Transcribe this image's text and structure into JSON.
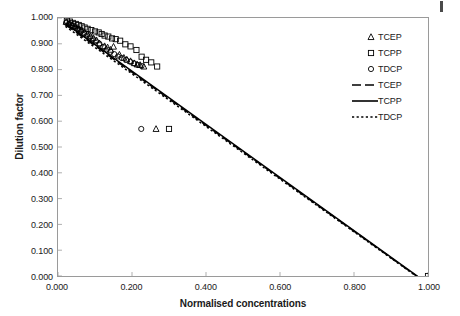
{
  "chart_data": {
    "type": "scatter",
    "title": "",
    "xlabel": "Normalised concentrations",
    "ylabel": "Dilution factor",
    "xlim": [
      0.0,
      1.0
    ],
    "ylim": [
      0.0,
      1.0
    ],
    "xticks": [
      "0.000",
      "0.200",
      "0.400",
      "0.600",
      "0.800",
      "1.000"
    ],
    "xtick_values": [
      0.0,
      0.2,
      0.4,
      0.6,
      0.8,
      1.0
    ],
    "yticks": [
      "0.000",
      "0.100",
      "0.200",
      "0.300",
      "0.400",
      "0.500",
      "0.600",
      "0.700",
      "0.800",
      "0.900",
      "1.000"
    ],
    "ytick_values": [
      0.0,
      0.1,
      0.2,
      0.3,
      0.4,
      0.5,
      0.6,
      0.7,
      0.8,
      0.9,
      1.0
    ],
    "grid": false,
    "legend_position": "top-right",
    "marker_series": [
      {
        "name": "TCEP",
        "marker": "triangle",
        "color": "#000000",
        "points": [
          [
            0.022,
            0.985
          ],
          [
            0.03,
            0.979
          ],
          [
            0.038,
            0.974
          ],
          [
            0.046,
            0.969
          ],
          [
            0.052,
            0.962
          ],
          [
            0.058,
            0.957
          ],
          [
            0.064,
            0.953
          ],
          [
            0.072,
            0.944
          ],
          [
            0.08,
            0.937
          ],
          [
            0.088,
            0.93
          ],
          [
            0.096,
            0.922
          ],
          [
            0.104,
            0.914
          ],
          [
            0.112,
            0.902
          ],
          [
            0.126,
            0.891
          ],
          [
            0.134,
            0.886
          ],
          [
            0.142,
            0.877
          ],
          [
            0.15,
            0.889
          ],
          [
            0.166,
            0.858
          ],
          [
            0.178,
            0.846
          ],
          [
            0.186,
            0.839
          ],
          [
            0.196,
            0.833
          ],
          [
            0.206,
            0.825
          ],
          [
            0.214,
            0.82
          ],
          [
            0.222,
            0.818
          ],
          [
            0.232,
            0.812
          ],
          [
            0.265,
            0.57
          ]
        ]
      },
      {
        "name": "TCPP",
        "marker": "square",
        "color": "#000000",
        "points": [
          [
            0.024,
            0.99
          ],
          [
            0.032,
            0.986
          ],
          [
            0.04,
            0.981
          ],
          [
            0.048,
            0.977
          ],
          [
            0.056,
            0.973
          ],
          [
            0.064,
            0.968
          ],
          [
            0.072,
            0.963
          ],
          [
            0.08,
            0.958
          ],
          [
            0.09,
            0.953
          ],
          [
            0.1,
            0.948
          ],
          [
            0.11,
            0.944
          ],
          [
            0.118,
            0.938
          ],
          [
            0.126,
            0.932
          ],
          [
            0.136,
            0.928
          ],
          [
            0.146,
            0.921
          ],
          [
            0.156,
            0.918
          ],
          [
            0.168,
            0.912
          ],
          [
            0.182,
            0.898
          ],
          [
            0.196,
            0.89
          ],
          [
            0.212,
            0.876
          ],
          [
            0.226,
            0.85
          ],
          [
            0.238,
            0.838
          ],
          [
            0.252,
            0.828
          ],
          [
            0.268,
            0.812
          ],
          [
            0.3,
            0.57
          ],
          [
            1.0,
            0.0
          ]
        ]
      },
      {
        "name": "TDCP",
        "marker": "circle",
        "color": "#000000",
        "points": [
          [
            0.022,
            0.982
          ],
          [
            0.03,
            0.976
          ],
          [
            0.038,
            0.97
          ],
          [
            0.046,
            0.963
          ],
          [
            0.054,
            0.956
          ],
          [
            0.062,
            0.948
          ],
          [
            0.07,
            0.94
          ],
          [
            0.078,
            0.932
          ],
          [
            0.086,
            0.925
          ],
          [
            0.094,
            0.918
          ],
          [
            0.102,
            0.91
          ],
          [
            0.112,
            0.9
          ],
          [
            0.122,
            0.888
          ],
          [
            0.132,
            0.878
          ],
          [
            0.142,
            0.869
          ],
          [
            0.152,
            0.86
          ],
          [
            0.162,
            0.851
          ],
          [
            0.172,
            0.845
          ],
          [
            0.184,
            0.838
          ],
          [
            0.196,
            0.83
          ],
          [
            0.206,
            0.824
          ],
          [
            0.216,
            0.818
          ],
          [
            0.226,
            0.814
          ],
          [
            0.225,
            0.57
          ]
        ]
      }
    ],
    "line_series": [
      {
        "name": "TCEP",
        "style": "dashed",
        "color": "#000000",
        "intercept": 0.995,
        "slope": -1.027,
        "x_range": [
          0.02,
          0.972
        ]
      },
      {
        "name": "TCPP",
        "style": "solid",
        "color": "#000000",
        "intercept": 1.0,
        "slope": -1.03,
        "x_range": [
          0.02,
          0.972
        ]
      },
      {
        "name": "TDCP",
        "style": "dotted",
        "color": "#000000",
        "intercept": 0.988,
        "slope": -1.021,
        "x_range": [
          0.02,
          0.968
        ]
      }
    ]
  },
  "legend": {
    "entries": [
      {
        "label": "TCEP",
        "kind": "marker",
        "marker": "triangle"
      },
      {
        "label": "TCPP",
        "kind": "marker",
        "marker": "square"
      },
      {
        "label": "TDCP",
        "kind": "marker",
        "marker": "circle"
      },
      {
        "label": "TCEP",
        "kind": "line",
        "style": "dashed"
      },
      {
        "label": "TCPP",
        "kind": "line",
        "style": "solid"
      },
      {
        "label": "TDCP",
        "kind": "line",
        "style": "dotted"
      }
    ]
  },
  "axes": {
    "x_title": "Normalised concentrations",
    "y_title": "Dilution factor"
  },
  "style": {
    "frame_color": "#9a9a9a",
    "ink_color": "#000000",
    "background": "#ffffff"
  }
}
